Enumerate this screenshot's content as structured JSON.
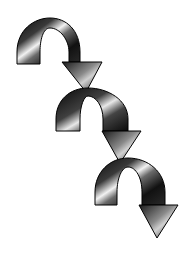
{
  "image": {
    "description": "Clip-art of three chained downward-curving arrows",
    "background": "#ffffff",
    "arrow_count": 3,
    "style": "metallic chrome gradient with black outline",
    "colors": {
      "dark": "#0a0a0a",
      "mid": "#5a5a5a",
      "highlight": "#f2f2f2",
      "outline": "#000000"
    },
    "icons": [
      "curved-arrow-icon",
      "curved-arrow-icon",
      "curved-arrow-icon"
    ]
  }
}
